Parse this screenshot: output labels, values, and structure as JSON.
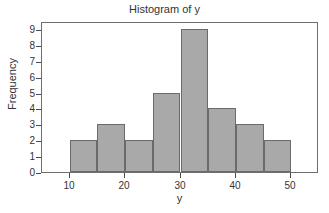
{
  "chart_data": {
    "type": "bar",
    "title": "Histogram of y",
    "xlabel": "y",
    "ylabel": "Frequency",
    "bin_width": 5,
    "bin_edges": [
      10,
      15,
      20,
      25,
      30,
      35,
      40,
      45,
      50
    ],
    "categories": [
      "10-15",
      "15-20",
      "20-25",
      "25-30",
      "30-35",
      "35-40",
      "40-45",
      "45-50"
    ],
    "values": [
      2,
      3,
      2,
      5,
      9,
      4,
      3,
      2
    ],
    "total_count": 30,
    "xlim": [
      5,
      55
    ],
    "ylim": [
      0,
      9.5
    ],
    "xticks": [
      10,
      20,
      30,
      40,
      50
    ],
    "xtick_labels": [
      "10",
      "20",
      "30",
      "40",
      "50"
    ],
    "yticks": [
      0,
      1,
      2,
      3,
      4,
      5,
      6,
      7,
      8,
      9
    ],
    "ytick_labels": [
      "0",
      "1",
      "2",
      "3",
      "4",
      "5",
      "6",
      "7",
      "8",
      "9"
    ],
    "grid": false,
    "legend": false,
    "bar_fill_color": "#a9a9a9",
    "bar_edge_color": "#6a6a6a",
    "frame_color": "#6e6e6e",
    "background_color": "#ffffff",
    "text_color": "#333333"
  }
}
